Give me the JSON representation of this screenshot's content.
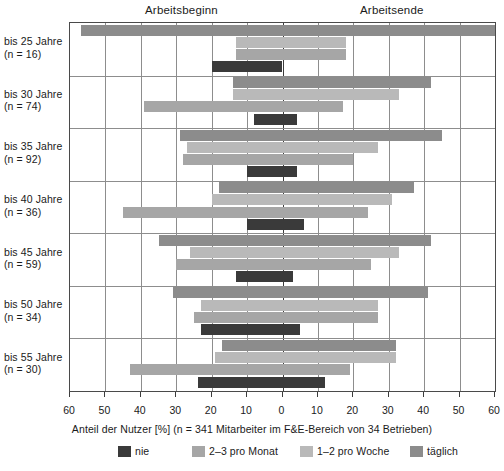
{
  "header": {
    "left_label": "Arbeitsbeginn",
    "right_label": "Arbeitsende"
  },
  "caption": "Anteil der Nutzer [%] (n = 341 Mitarbeiter im F&E-Bereich von 34 Betrieben)",
  "legend": {
    "items": [
      {
        "label": "nie",
        "color": "#3a3a3a"
      },
      {
        "label": "2–3 pro Monat",
        "color": "#a6a6a6"
      },
      {
        "label": "1–2 pro Woche",
        "color": "#b9b9b9"
      },
      {
        "label": "täglich",
        "color": "#8c8c8c"
      }
    ]
  },
  "chart_data": {
    "type": "bar",
    "orientation": "horizontal-diverging",
    "title": "",
    "subtitle": "",
    "xlabel": "Anteil der Nutzer [%] (n = 341 Mitarbeiter im F&E-Bereich von 34 Betrieben)",
    "ylabel": "",
    "xlim": [
      -60,
      60
    ],
    "xticks": [
      -60,
      -50,
      -40,
      -30,
      -20,
      -10,
      0,
      10,
      20,
      30,
      40,
      50,
      60
    ],
    "xticklabels": [
      "60",
      "50",
      "40",
      "30",
      "20",
      "10",
      "0",
      "10",
      "20",
      "30",
      "40",
      "50",
      "60"
    ],
    "grid": true,
    "legend_position": "bottom",
    "left_axis_meaning": "Arbeitsbeginn",
    "right_axis_meaning": "Arbeitsende",
    "categories": [
      {
        "label": "bis 25 Jahre",
        "n_label": "(n = 16)",
        "n": 16
      },
      {
        "label": "bis 30 Jahre",
        "n_label": "(n = 74)",
        "n": 74
      },
      {
        "label": "bis 35 Jahre",
        "n_label": "(n = 92)",
        "n": 92
      },
      {
        "label": "bis 40 Jahre",
        "n_label": "(n = 36)",
        "n": 36
      },
      {
        "label": "bis 45 Jahre",
        "n_label": "(n = 59)",
        "n": 59
      },
      {
        "label": "bis 50 Jahre",
        "n_label": "(n = 34)",
        "n": 34
      },
      {
        "label": "bis 55 Jahre",
        "n_label": "(n = 30)",
        "n": 30
      }
    ],
    "series": [
      {
        "name": "täglich",
        "color": "#8c8c8c",
        "spans": [
          {
            "start": -57,
            "end": 60
          },
          {
            "start": -14,
            "end": 42
          },
          {
            "start": -29,
            "end": 45
          },
          {
            "start": -18,
            "end": 37
          },
          {
            "start": -35,
            "end": 42
          },
          {
            "start": -31,
            "end": 41
          },
          {
            "start": -17,
            "end": 32
          }
        ]
      },
      {
        "name": "1–2 pro Woche",
        "color": "#b9b9b9",
        "spans": [
          {
            "start": -13,
            "end": 18
          },
          {
            "start": -14,
            "end": 33
          },
          {
            "start": -27,
            "end": 27
          },
          {
            "start": -20,
            "end": 31
          },
          {
            "start": -26,
            "end": 33
          },
          {
            "start": -23,
            "end": 27
          },
          {
            "start": -19,
            "end": 32
          }
        ]
      },
      {
        "name": "2–3 pro Monat",
        "color": "#a6a6a6",
        "spans": [
          {
            "start": -13,
            "end": 18
          },
          {
            "start": -39,
            "end": 17
          },
          {
            "start": -28,
            "end": 20
          },
          {
            "start": -45,
            "end": 24
          },
          {
            "start": -30,
            "end": 25
          },
          {
            "start": -25,
            "end": 27
          },
          {
            "start": -43,
            "end": 19
          }
        ]
      },
      {
        "name": "nie",
        "color": "#3a3a3a",
        "spans": [
          {
            "start": -20,
            "end": 0
          },
          {
            "start": -8,
            "end": 4
          },
          {
            "start": -10,
            "end": 4
          },
          {
            "start": -10,
            "end": 6
          },
          {
            "start": -13,
            "end": 3
          },
          {
            "start": -23,
            "end": 5
          },
          {
            "start": -24,
            "end": 12
          }
        ]
      }
    ]
  }
}
